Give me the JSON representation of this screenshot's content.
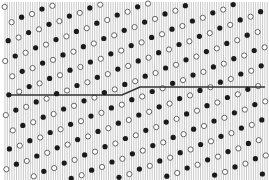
{
  "figure": {
    "width": 269,
    "height": 180,
    "background": "#ffffff",
    "vertical_lines": {
      "x_start": 5,
      "x_end": 268,
      "spacing": 2.3,
      "y_start": 2,
      "y_end": 180,
      "color": "#9a9a9a",
      "width": 0.55
    },
    "lattice": {
      "origin_filled": [
        42,
        9
      ],
      "origin_hollow": [
        32,
        14
      ],
      "row_vector": [
        20.4,
        -8.2
      ],
      "col_vector": [
        7.0,
        15.3
      ],
      "filled_color": "#1a1a1a",
      "hollow_stroke": "#555555",
      "hollow_fill": "#ffffff",
      "radius": 2.6
    },
    "boundary_line": {
      "points": [
        [
          8,
          95
        ],
        [
          122,
          95
        ],
        [
          140,
          87
        ],
        [
          265,
          87
        ]
      ],
      "color": "#333333",
      "width": 1.6
    }
  }
}
